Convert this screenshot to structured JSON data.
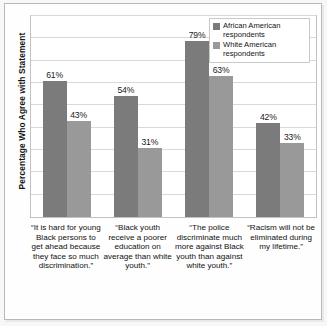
{
  "chart_data": {
    "type": "bar",
    "title": "",
    "subtitle": "",
    "xlabel": "",
    "ylabel": "Percentage Who Agree with Statement",
    "ylim": [
      0,
      90
    ],
    "grid": true,
    "y_tick_labels": [],
    "legend_position": "top-right",
    "categories": [
      "“It is hard for young Black persons to get ahead because they face so much discrimination.”",
      "“Black youth receive a poorer education on average than white youth.”",
      "“The police discriminate much more against Black youth than against white youth.”",
      "“Racism will not be eliminated during my lifetime.”"
    ],
    "series": [
      {
        "name": "African American respondents",
        "color": "#7b7b7b",
        "values": [
          61,
          54,
          79,
          42
        ],
        "value_labels": [
          "61%",
          "54%",
          "79%",
          "42%"
        ]
      },
      {
        "name": "White American respondents",
        "color": "#999999",
        "values": [
          43,
          31,
          63,
          33
        ],
        "value_labels": [
          "43%",
          "31%",
          "63%",
          "33%"
        ]
      }
    ],
    "gridline_values": [
      10,
      20,
      30,
      40,
      50,
      60,
      70,
      80,
      90
    ]
  },
  "legend": {
    "entries": [
      "African American respondents",
      "White American respondents"
    ]
  }
}
